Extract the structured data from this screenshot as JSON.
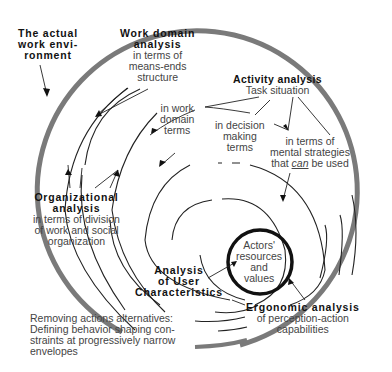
{
  "diagram": {
    "type": "concentric-spiral-framework",
    "labels": {
      "work_environment": {
        "lines": [
          "The actual",
          "work envi-",
          "ronment"
        ]
      },
      "work_domain": {
        "title": [
          "Work domain",
          "analysis"
        ],
        "sub": [
          "in terms of",
          "means-ends",
          "structure"
        ]
      },
      "activity": {
        "title": [
          "Activity analysis"
        ],
        "sub": [
          "Task situation"
        ]
      },
      "work_domain_terms": {
        "sub": [
          "in work",
          "domain",
          "terms"
        ]
      },
      "decision_terms": {
        "sub": [
          "in decision",
          "making",
          "terms"
        ]
      },
      "mental_strategies": {
        "sub": [
          "in terms of",
          "mental strategies"
        ],
        "last_prefix": "that ",
        "last_em": "can",
        "last_suffix": " be used"
      },
      "organizational": {
        "title": [
          "Organizational",
          "analysis"
        ],
        "sub": [
          "in terms of  division",
          "of work and social",
          "organization"
        ]
      },
      "actors": {
        "sub": [
          "Actors'",
          "resources",
          "and",
          "values"
        ]
      },
      "user_characteristics": {
        "title": [
          "Analysis",
          "of User",
          "Characteristics"
        ]
      },
      "ergonomic": {
        "title": [
          "Ergonomic analysis"
        ],
        "sub": [
          "of perception-action",
          "capabilities"
        ]
      },
      "constraints": {
        "lines": [
          "Removing actions alternatives:",
          "Defining behavior shaping con-",
          "straints at progressively narrow",
          "envelopes"
        ]
      }
    },
    "colors": {
      "outer_ring": "#777777",
      "inner_ring": "#111111",
      "lines": "#222222"
    }
  }
}
